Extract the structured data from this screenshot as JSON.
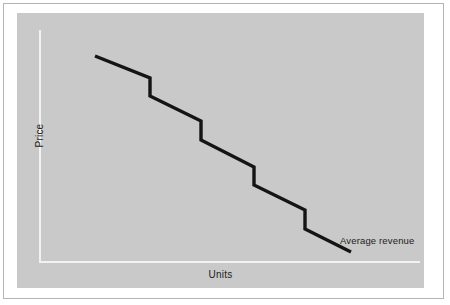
{
  "figure": {
    "frame_border_color": "#b4b4b4",
    "page_background": "#ffffff",
    "panel_background": "#c9c9c9",
    "axis_line_color": "#f2f2f2",
    "series_color": "#141414"
  },
  "axes": {
    "y_title": "Price",
    "x_title": "Units"
  },
  "annotations": {
    "series_label": "Average revenue"
  },
  "chart_data": {
    "type": "line",
    "title": "",
    "subtitle": "",
    "xlabel": "Units",
    "ylabel": "Price",
    "grid": false,
    "legend_position": "inline-end-of-line",
    "axis_ticks_shown": false,
    "xlim": [
      0,
      100
    ],
    "ylim": [
      0,
      100
    ],
    "series": [
      {
        "name": "Average revenue",
        "color": "#141414",
        "style": "stepped-descending",
        "points_px": [
          [
            78,
            43
          ],
          [
            133,
            65
          ],
          [
            133,
            83
          ],
          [
            184,
            108
          ],
          [
            184,
            127
          ],
          [
            237,
            154
          ],
          [
            237,
            172
          ],
          [
            288,
            197
          ],
          [
            288,
            216
          ],
          [
            334,
            239
          ]
        ],
        "x": [
          14.5,
          28.1,
          28.1,
          40.7,
          40.7,
          53.8,
          53.8,
          66.4,
          66.4,
          77.8
        ],
        "y": [
          90.5,
          80.9,
          73.0,
          62.1,
          53.9,
          42.1,
          34.3,
          23.4,
          15.2,
          5.2
        ],
        "segments": [
          {
            "kind": "diagonal",
            "from": [
              14.5,
              90.5
            ],
            "to": [
              28.1,
              80.9
            ]
          },
          {
            "kind": "vertical-drop",
            "from": [
              28.1,
              80.9
            ],
            "to": [
              28.1,
              73.0
            ]
          },
          {
            "kind": "diagonal",
            "from": [
              28.1,
              73.0
            ],
            "to": [
              40.7,
              62.1
            ]
          },
          {
            "kind": "vertical-drop",
            "from": [
              40.7,
              62.1
            ],
            "to": [
              40.7,
              53.9
            ]
          },
          {
            "kind": "diagonal",
            "from": [
              40.7,
              53.9
            ],
            "to": [
              53.8,
              42.1
            ]
          },
          {
            "kind": "vertical-drop",
            "from": [
              53.8,
              42.1
            ],
            "to": [
              53.8,
              34.3
            ]
          },
          {
            "kind": "diagonal",
            "from": [
              53.8,
              34.3
            ],
            "to": [
              66.4,
              23.4
            ]
          },
          {
            "kind": "vertical-drop",
            "from": [
              66.4,
              23.4
            ],
            "to": [
              66.4,
              15.2
            ]
          },
          {
            "kind": "diagonal",
            "from": [
              66.4,
              15.2
            ],
            "to": [
              77.8,
              5.2
            ]
          }
        ]
      }
    ],
    "path_d": "M 78 43 L 133 65 L 133 83 L 184 108 L 184 127 L 237 154 L 237 172 L 288 197 L 288 216 L 334 239"
  }
}
